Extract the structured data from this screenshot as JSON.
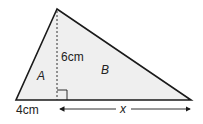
{
  "diagram": {
    "type": "triangle-split-by-height",
    "colors": {
      "fill": "#efefef",
      "stroke": "#1a1a1a",
      "text": "#222222"
    },
    "vertices": {
      "apex": [
        57,
        9
      ],
      "base_left": [
        16,
        100
      ],
      "base_right": [
        191,
        100
      ],
      "foot": [
        57,
        100
      ]
    },
    "labels": {
      "height": "6cm",
      "region_left": "A",
      "region_right": "B",
      "base_left_length": "4cm",
      "base_right_length": "x"
    }
  }
}
